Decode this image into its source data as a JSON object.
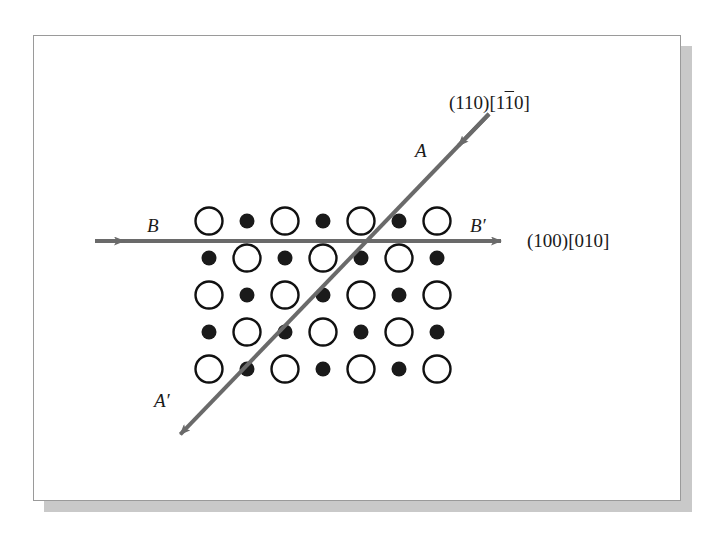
{
  "figure": {
    "kind": "crystal-lattice-slip-plane-diagram",
    "background_color": "#ffffff",
    "panel": {
      "border_color": "#9a9a9a",
      "fill_color": "#ffffff",
      "shadow_color": "#c9c9c9"
    }
  },
  "labels": {
    "trace_a": "A",
    "trace_a_prime": "A′",
    "trace_b": "B",
    "trace_b_prime": "B′",
    "plane_110_prefix": "(110)[1",
    "plane_110_overbar": "1",
    "plane_110_suffix": "0]",
    "plane_100": "(100)[010]"
  },
  "lines": {
    "color": "#6a6a6a",
    "width": 4,
    "diagonal": {
      "name": "A-A-prime",
      "x1": 489,
      "y1": 114,
      "x2": 172,
      "y2": 443,
      "arrow_ends": [
        "upper-right-inward",
        "lower-left"
      ]
    },
    "horizontal": {
      "name": "B-B-prime",
      "x1": 95,
      "y1": 241,
      "x2": 513,
      "y2": 241,
      "arrow_ends": [
        "left-inward",
        "right"
      ]
    }
  },
  "lattice": {
    "origin_x": 209,
    "origin_y": 221,
    "col_spacing": 38,
    "row_spacing": 37,
    "columns": 7,
    "rows": 5,
    "open_circle": {
      "label": "large-open-atom",
      "radius": 13.5,
      "stroke": "#111111",
      "stroke_width": 2.4,
      "fill": "#ffffff"
    },
    "filled_circle": {
      "label": "small-filled-atom",
      "radius": 7.5,
      "fill": "#1a1a1a"
    },
    "row_pattern": [
      [
        "open",
        "filled",
        "open",
        "filled",
        "open",
        "filled",
        "open"
      ],
      [
        "filled",
        "open",
        "filled",
        "open",
        "filled",
        "open",
        "filled"
      ],
      [
        "open",
        "filled",
        "open",
        "filled",
        "open",
        "filled",
        "open"
      ],
      [
        "filled",
        "open",
        "filled",
        "open",
        "filled",
        "open",
        "filled"
      ],
      [
        "open",
        "filled",
        "open",
        "filled",
        "open",
        "filled",
        "open"
      ]
    ]
  }
}
